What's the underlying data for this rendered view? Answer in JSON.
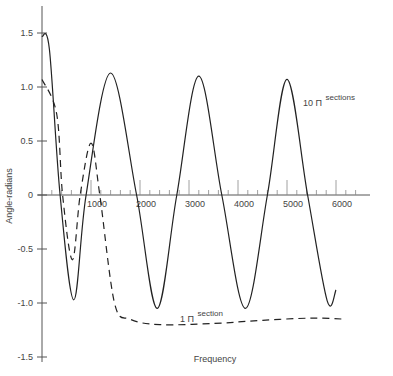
{
  "chart_data": {
    "type": "line",
    "title": "",
    "xlabel": "Frequency",
    "ylabel": "Angle-radians",
    "xlim": [
      0,
      6500
    ],
    "ylim": [
      -1.5,
      1.6
    ],
    "grid": false,
    "legend": "inline annotations",
    "x_ticks": [
      "1000",
      "2000",
      "3000",
      "4000",
      "5000",
      "6000"
    ],
    "y_ticks": [
      "1.5",
      "1.0",
      "0.5",
      "0",
      "-0.5",
      "-1.0",
      "-1.5"
    ],
    "annotations": [
      {
        "text": "10 Π",
        "sup": "sections",
        "series": "10 Π sections"
      },
      {
        "text": "1 Π",
        "sup": "section",
        "series": "1 Π section"
      }
    ],
    "series": [
      {
        "name": "10 Π sections",
        "style": "solid",
        "x": [
          0,
          150,
          370,
          650,
          900,
          1400,
          1930,
          2350,
          2750,
          3200,
          3670,
          4150,
          4600,
          5000,
          5420,
          5820,
          6000
        ],
        "y": [
          1.47,
          1.35,
          0.0,
          -0.97,
          0.0,
          1.13,
          0.0,
          -1.05,
          0.0,
          1.1,
          0.0,
          -1.05,
          0.0,
          1.07,
          0.0,
          -0.98,
          -0.88
        ]
      },
      {
        "name": "1 Π section",
        "style": "dashed",
        "x": [
          0,
          300,
          420,
          620,
          780,
          1000,
          1180,
          1480,
          1800,
          2400,
          3500,
          4500,
          5500,
          6200
        ],
        "y": [
          1.07,
          0.75,
          0.0,
          -0.6,
          0.0,
          0.48,
          0.0,
          -1.0,
          -1.15,
          -1.2,
          -1.19,
          -1.16,
          -1.14,
          -1.15
        ]
      }
    ]
  },
  "axes": {
    "x_title": "Frequency",
    "y_title": "Angle-radians"
  },
  "labels": {
    "ten_sections_main": "10 Π",
    "ten_sections_sup": "sections",
    "one_section_main": "1 Π",
    "one_section_sup": "section"
  }
}
